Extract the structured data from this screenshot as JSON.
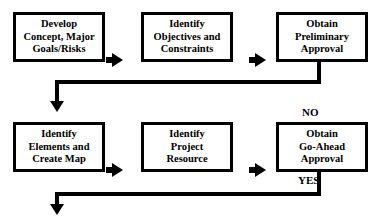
{
  "diagram": {
    "colors": {
      "stroke": "#000000",
      "fill": "#ffffff",
      "text": "#000000"
    },
    "nodes": [
      {
        "id": "develop-concept",
        "lines": [
          "Develop",
          "Concept, Major",
          "Goals/Risks"
        ]
      },
      {
        "id": "identify-objectives",
        "lines": [
          "Identify",
          "Objectives and",
          "Constraints"
        ]
      },
      {
        "id": "obtain-preliminary-approval",
        "lines": [
          "Obtain",
          "Preliminary",
          "Approval"
        ]
      },
      {
        "id": "identify-elements",
        "lines": [
          "Identify",
          "Elements and",
          "Create Map"
        ]
      },
      {
        "id": "identify-project-resource",
        "lines": [
          "Identify",
          "Project",
          "Resource"
        ]
      },
      {
        "id": "obtain-go-ahead-approval",
        "lines": [
          "Obtain",
          "Go-Ahead",
          "Approval"
        ]
      }
    ],
    "edge_labels": [
      {
        "id": "no-label",
        "text": "NO"
      },
      {
        "id": "yes-label",
        "text": "YES"
      }
    ]
  }
}
